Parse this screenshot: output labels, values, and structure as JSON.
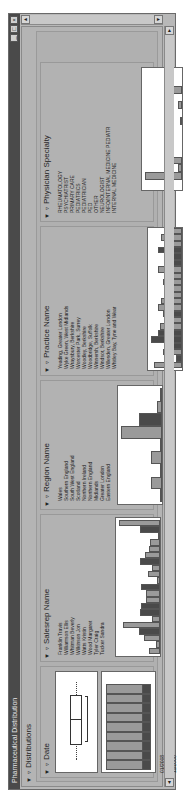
{
  "window": {
    "title": "Pharmaceutical Distribution",
    "controls": [
      "minimize",
      "maximize",
      "close"
    ]
  },
  "report": {
    "outline_title": "Distributions",
    "panels": [
      {
        "title": "Date",
        "type": "histogram-with-boxplot",
        "axis_labels": [
          "01/2008",
          "12/2008",
          "11/2008",
          "10/2008",
          "09/2008",
          "08/2008",
          "07/2008",
          "06/2008",
          "05/2008",
          "04/2008"
        ]
      },
      {
        "title": "Salesrep Name",
        "type": "bar",
        "labels": [
          "Franklin Travis",
          "Williamson Ellis",
          "Whitman Beverly",
          "Wilkinson Jon",
          "Watts Kristin",
          "Wood Margaret",
          "Tyler Craig",
          "Tucker Sandra",
          "Turner Anthony",
          "Thornton Lewis",
          "Stevens Trevor",
          "Stone Helen",
          "Stuart Andrew",
          "Smith Kathleen",
          "Sharp Leonard",
          "Shaw Catherine",
          "Scott Ruth",
          "Ryan Denise",
          "Russell Patricia",
          "Rowe Dennis",
          "Ross Graham"
        ]
      },
      {
        "title": "Region Name",
        "type": "bar",
        "labels": [
          "Wales",
          "Southern England",
          "South West England",
          "Scotland",
          "Northern Ireland",
          "Northern England",
          "Midlands",
          "Greater London",
          "Eastern England"
        ]
      },
      {
        "title": "Practice Name",
        "type": "bar",
        "labels": [
          "Yeading, Greater London",
          "Wyke Green, West Midlands",
          "Wraysbury, Berkshire",
          "Worcester Park, Surrey",
          "Woodley, Berkshire",
          "Woodbridge, Suffolk",
          "Winnersh, Berkshire",
          "Windsor, Berkshire",
          "Willesden, Greater London",
          "Whitley Bay, Tyne and Wear",
          "Weybridge, Surrey",
          "West Drayton, Greater London",
          "Wembley, Greater London",
          "Welwyn, Hertfordshire",
          "Wellingborough, Northamptonshire",
          "Watford, Hertfordshire",
          "Warrington, Cheshire",
          "Walsall, West Midlands",
          "Wallington, Surrey",
          "Wakefield, West Yorkshire"
        ]
      },
      {
        "title": "Physician Specialty",
        "type": "bar",
        "labels": [
          "RHEUMATOLOGY",
          "PSYCHIATRIST",
          "PRIMARY CARE",
          "PEDIATRICS",
          "PEDIATRICIAN",
          "PED",
          "OTHER",
          "NEUROLOGIST",
          "INFO/INTERNAL MEDICINE PEDIATR",
          "INTERNAL MEDICINE",
          "GENERAL PRACTICE",
          "FAMILY PRACTICE",
          "FAM",
          "CHILD/CHILD NEUROLOGIST",
          "ADOLESCENT MEDICINE"
        ]
      }
    ]
  },
  "chart_data": [
    {
      "type": "bar",
      "title": "Date",
      "categories": [
        "01/2008",
        "12/2008",
        "11/2008",
        "10/2008",
        "09/2008",
        "08/2008",
        "07/2008",
        "06/2008",
        "05/2008"
      ],
      "series": [
        {
          "name": "total",
          "values": [
            100,
            100,
            100,
            100,
            100,
            100,
            100,
            100,
            100
          ]
        },
        {
          "name": "selected",
          "values": [
            20,
            20,
            20,
            20,
            20,
            20,
            20,
            20,
            20
          ]
        }
      ],
      "boxplot": {
        "min": 0.12,
        "q1": 0.27,
        "median": 0.5,
        "q3": 0.77,
        "max": 0.9
      }
    },
    {
      "type": "bar",
      "title": "Salesrep Name",
      "categories": [
        "Franklin Travis",
        "Williamson Ellis",
        "Whitman Beverly",
        "Wilkinson Jon",
        "Watts Kristin",
        "Wood Margaret",
        "Tyler Craig",
        "Tucker Sandra",
        "Turner Anthony",
        "Thornton Lewis",
        "Stevens Trevor",
        "Stone Helen",
        "Stuart Andrew",
        "Smith Kathleen",
        "Sharp Leonard",
        "Shaw Catherine",
        "Scott Ruth",
        "Ryan Denise",
        "Russell Patricia",
        "Rowe Dennis",
        "Ross Graham"
      ],
      "values": [
        28,
        10,
        38,
        52,
        90,
        20,
        48,
        46,
        34,
        35,
        46,
        7,
        30,
        20,
        48,
        36,
        28,
        25,
        4,
        48,
        100
      ]
    },
    {
      "type": "bar",
      "title": "Region Name",
      "categories": [
        "Wales",
        "Southern England",
        "South West England",
        "Scotland",
        "Northern Ireland",
        "Northern England",
        "Midlands",
        "Greater London",
        "Eastern England"
      ],
      "values": [
        5,
        27,
        4,
        28,
        1,
        100,
        55,
        12,
        2
      ]
    },
    {
      "type": "bar",
      "title": "Practice Name",
      "values": [
        65,
        13,
        45,
        32,
        72,
        55,
        50,
        42,
        45,
        55,
        48,
        37,
        35,
        45,
        38,
        55,
        35,
        30,
        55,
        42,
        48,
        40
      ]
    },
    {
      "type": "bar",
      "title": "Physician Specialty",
      "categories": [
        "RHEUMATOLOGY",
        "PSYCHIATRIST",
        "PRIMARY CARE",
        "PEDIATRICS",
        "PEDIATRICIAN",
        "PED",
        "OTHER",
        "NEUROLOGIST",
        "INFO/INTERNAL MEDICINE PEDIATR",
        "INTERNAL MEDICINE",
        "GENERAL PRACTICE",
        "FAMILY PRACTICE",
        "FAM",
        "CHILD/CHILD NEUROLOGIST",
        "ADOLESCENT MEDICINE"
      ],
      "values": [
        0,
        100,
        10,
        45,
        0,
        0,
        0,
        0,
        5,
        0,
        12,
        0,
        30,
        0,
        0
      ]
    }
  ]
}
